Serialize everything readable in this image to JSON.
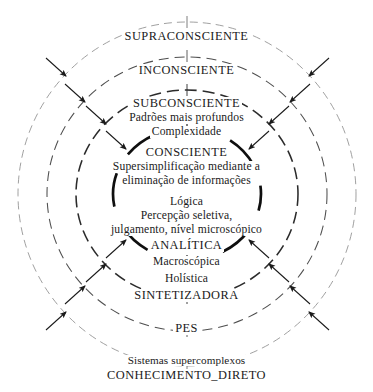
{
  "diagram": {
    "type": "concentric-circles",
    "background_color": "#ffffff",
    "stroke_color": "#1a1a1a",
    "arrow_direction": "inward",
    "rings": [
      {
        "id": "supraconsciente",
        "index": 1,
        "label": "SUPRACONSCIENTE",
        "position": "outermost",
        "stroke": "#8a8a8a",
        "stroke_width": 0.8,
        "rx": 168,
        "ry": 167,
        "dash": "7 5"
      },
      {
        "id": "inconsciente",
        "index": 2,
        "label": "INCONSCIENTE",
        "stroke": "#4a4a4a",
        "stroke_width": 1.0,
        "rx": 137,
        "ry": 133,
        "dash": "9 6"
      },
      {
        "id": "subconsciente",
        "index": 3,
        "label": "SUBCONSCIENTE",
        "stroke": "#2a2a2a",
        "stroke_width": 1.5,
        "rx": 109,
        "ry": 103,
        "dash": "11 6"
      },
      {
        "id": "consciente",
        "index": 4,
        "label": "CONSCIENTE",
        "stroke": "#111111",
        "stroke_width": 2.6,
        "rx": 74,
        "ry": 66,
        "dash": "30 12"
      }
    ],
    "outer_ring_bottom_label": "CONHECIMENTO_DIRETO",
    "labels": {
      "supraconsciente": "SUPRACONSCIENTE",
      "inconsciente": "INCONSCIENTE",
      "subconsciente": "SUBCONSCIENTE",
      "subconsciente_desc_1": "Padrões mais profundos",
      "subconsciente_desc_2": "Complexidade",
      "consciente": "CONSCIENTE",
      "consciente_desc_1": "Supersimplificação mediante a",
      "consciente_desc_2": "eliminação de informações",
      "analitica_desc_1": "Lógica",
      "analitica_desc_2": "Percepção seletiva,",
      "analitica_desc_3": "julgamento, nível microscópico",
      "analitica": "ANALÍTICA",
      "sintetizadora_desc_1": "Macroscópica",
      "sintetizadora_desc_2": "Holística",
      "sintetizadora": "SINTETIZADORA",
      "pes": "PES",
      "conhecimento_desc_1": "Sistemas supercomplexos",
      "conhecimento_direto": "CONHECIMENTO_DIRETO"
    },
    "arrows": {
      "count": 16,
      "description": "Setas apontando para dentro, em direção ao centro",
      "color": "#1a1a1a"
    }
  }
}
